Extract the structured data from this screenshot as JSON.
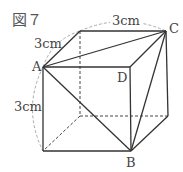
{
  "figure": {
    "title": "図７",
    "labels": {
      "A": "A",
      "B": "B",
      "C": "C",
      "D": "D"
    },
    "dimensions": {
      "top_edge": "3cm",
      "depth_edge": "3cm",
      "height_edge": "3cm"
    },
    "colors": {
      "solid": "#333333",
      "hidden": "#444444",
      "arc": "#aaaaaa"
    }
  }
}
